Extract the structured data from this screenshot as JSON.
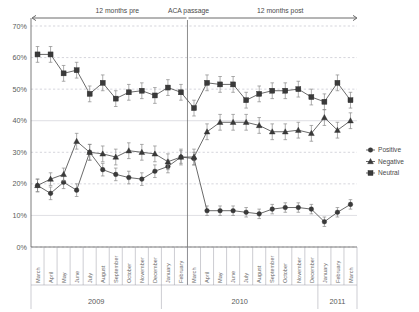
{
  "chart_data": {
    "type": "line",
    "title": "",
    "xlabel": "",
    "ylabel": "",
    "ylim": [
      0,
      70
    ],
    "yticks": [
      "0%",
      "10%",
      "20%",
      "30%",
      "40%",
      "50%",
      "60%",
      "70%"
    ],
    "grid": true,
    "legend_position": "right",
    "categories": [
      "March",
      "April",
      "May",
      "June",
      "July",
      "August",
      "September",
      "October",
      "November",
      "December",
      "January",
      "February",
      "March",
      "April",
      "May",
      "June",
      "July",
      "August",
      "September",
      "October",
      "November",
      "December",
      "January",
      "February",
      "March"
    ],
    "year_groups": [
      {
        "label": "2009",
        "start_index": 0,
        "end_index": 9
      },
      {
        "label": "2010",
        "start_index": 10,
        "end_index": 21
      },
      {
        "label": "2011",
        "start_index": 22,
        "end_index": 24
      }
    ],
    "series": [
      {
        "name": "Positive",
        "marker": "circle",
        "values": [
          19.5,
          17.0,
          20.5,
          18.0,
          30.0,
          24.5,
          23.0,
          22.0,
          21.5,
          24.0,
          25.5,
          28.5,
          28.0,
          11.5,
          11.5,
          11.5,
          11.0,
          10.5,
          12.0,
          12.5,
          12.5,
          12.0,
          8.0,
          11.0,
          13.5
        ],
        "errors": [
          2.0,
          2.0,
          2.0,
          2.0,
          2.5,
          2.0,
          2.0,
          2.0,
          2.0,
          2.0,
          2.0,
          2.0,
          2.0,
          1.5,
          1.5,
          1.5,
          1.5,
          1.5,
          1.5,
          1.5,
          1.5,
          1.5,
          1.5,
          1.5,
          1.5
        ]
      },
      {
        "name": "Negative",
        "marker": "triangle",
        "values": [
          19.5,
          21.5,
          23.0,
          33.5,
          30.0,
          29.5,
          28.5,
          30.5,
          30.0,
          29.5,
          27.0,
          28.5,
          28.5,
          36.5,
          39.5,
          39.5,
          39.5,
          38.5,
          36.5,
          36.5,
          37.0,
          36.0,
          41.0,
          37.0,
          40.0
        ],
        "errors": [
          2.0,
          2.0,
          2.0,
          2.5,
          2.5,
          2.5,
          2.5,
          2.5,
          2.5,
          2.5,
          2.5,
          2.5,
          2.5,
          2.5,
          2.5,
          2.5,
          2.5,
          2.5,
          2.5,
          2.5,
          2.5,
          2.5,
          2.5,
          2.5,
          2.5
        ]
      },
      {
        "name": "Neutral",
        "marker": "square",
        "values": [
          61.0,
          61.0,
          55.0,
          56.0,
          48.5,
          52.0,
          47.0,
          49.0,
          49.5,
          48.0,
          50.5,
          49.0,
          44.0,
          52.0,
          51.5,
          51.5,
          46.5,
          48.5,
          49.5,
          49.5,
          50.0,
          47.5,
          46.0,
          52.0,
          46.5
        ],
        "errors": [
          2.5,
          2.5,
          2.5,
          2.5,
          2.5,
          2.5,
          2.5,
          2.5,
          2.5,
          2.5,
          2.5,
          2.5,
          2.5,
          2.5,
          2.5,
          2.5,
          2.5,
          2.5,
          2.5,
          2.5,
          2.5,
          2.5,
          2.5,
          2.5,
          2.5
        ]
      }
    ],
    "annotations": [
      {
        "name": "pre-period",
        "text": "12 months pre"
      },
      {
        "name": "aca-marker",
        "text": "ACA passage"
      },
      {
        "name": "post-period",
        "text": "12 months post"
      }
    ],
    "aca_index": 12
  }
}
